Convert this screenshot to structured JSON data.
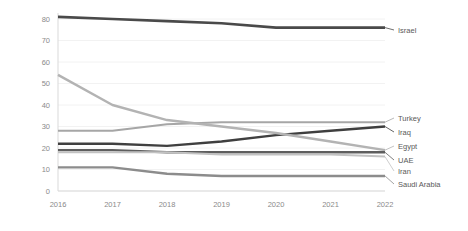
{
  "chart_data": {
    "type": "line",
    "title": "",
    "subtitle": "",
    "xlabel": "",
    "ylabel": "",
    "x": [
      2016,
      2017,
      2018,
      2019,
      2020,
      2021,
      2022
    ],
    "xtick_labels": [
      "2016",
      "2017",
      "2018",
      "2019",
      "2020",
      "2021",
      "2022"
    ],
    "ytick_labels": [
      "0",
      "10",
      "20",
      "30",
      "40",
      "50",
      "60",
      "70",
      "80"
    ],
    "yticks": [
      0,
      10,
      20,
      30,
      40,
      50,
      60,
      70,
      80
    ],
    "ylim": [
      0,
      80
    ],
    "grid": true,
    "legend_position": "right-end-of-line",
    "series": [
      {
        "name": "Israel",
        "color": "#4a4a4a",
        "width": 2.6,
        "values": [
          81,
          80,
          79,
          78,
          76,
          76,
          76
        ]
      },
      {
        "name": "Turkey",
        "color": "#a6a6a6",
        "width": 2.0,
        "values": [
          28,
          28,
          31,
          32,
          32,
          32,
          32
        ]
      },
      {
        "name": "Iraq",
        "color": "#3f3f3f",
        "width": 2.4,
        "values": [
          22,
          22,
          21,
          23,
          26,
          28,
          30
        ]
      },
      {
        "name": "Egypt",
        "color": "#b3b3b3",
        "width": 2.4,
        "values": [
          54,
          40,
          33,
          30,
          27,
          23,
          19
        ]
      },
      {
        "name": "UAE",
        "color": "#5e5e5e",
        "width": 2.4,
        "values": [
          19,
          19,
          18,
          18,
          18,
          18,
          18
        ]
      },
      {
        "name": "Iran",
        "color": "#c2c2c2",
        "width": 2.0,
        "values": [
          18,
          18,
          18,
          17,
          17,
          17,
          16
        ]
      },
      {
        "name": "Saudi Arabia",
        "color": "#8c8c8c",
        "width": 2.4,
        "values": [
          11,
          11,
          8,
          7,
          7,
          7,
          7
        ]
      }
    ],
    "legend_entries": [
      {
        "label": "Israel",
        "color": "#4a4a4a"
      },
      {
        "label": "Turkey",
        "color": "#a6a6a6"
      },
      {
        "label": "Iraq",
        "color": "#3f3f3f"
      },
      {
        "label": "Egypt",
        "color": "#b3b3b3"
      },
      {
        "label": "UAE",
        "color": "#5e5e5e"
      },
      {
        "label": "Iran",
        "color": "#c2c2c2"
      },
      {
        "label": "Saudi Arabia",
        "color": "#8c8c8c"
      }
    ]
  },
  "legend_positions": {
    "Israel": 30,
    "Turkey": 118,
    "Iraq": 132,
    "Egypt": 146,
    "UAE": 160,
    "Iran": 171,
    "Saudi Arabia": 184
  }
}
